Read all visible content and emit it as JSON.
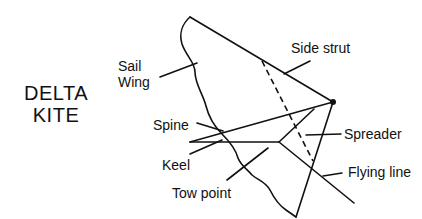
{
  "title": {
    "line1": "DELTA",
    "line2": "KITE"
  },
  "labels": {
    "sail": "Sail",
    "wing": "Wing",
    "side_strut": "Side strut",
    "spine": "Spine",
    "spreader": "Spreader",
    "keel": "Keel",
    "flying_line": "Flying line",
    "tow_point": "Tow point"
  },
  "colors": {
    "ink": "#111111",
    "background": "#ffffff"
  }
}
